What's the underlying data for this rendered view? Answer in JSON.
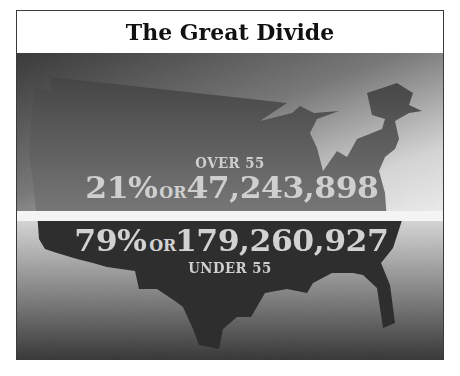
{
  "title": "The Great Divide",
  "colors": {
    "frame_border": "#3a3a3a",
    "title_text": "#111111",
    "upper_map": "#6e6e6e",
    "lower_map": "#2e2e2e",
    "divider_band": "#f4f4f4",
    "stat_text": "#cfcfcf"
  },
  "over": {
    "label": "OVER 55",
    "percent": "21%",
    "connector": "OR",
    "count": "47,243,898",
    "share": 0.21
  },
  "under": {
    "label": "UNDER 55",
    "percent": "79%",
    "connector": "OR",
    "count": "179,260,927",
    "share": 0.79
  },
  "map": {
    "subject": "us-map-silhouette"
  }
}
